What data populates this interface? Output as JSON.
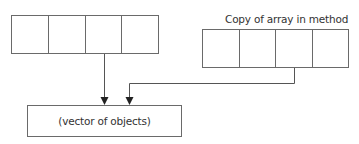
{
  "diagram": {
    "original_array": {
      "label": "",
      "cells": [
        "",
        "",
        "",
        ""
      ]
    },
    "copy_array": {
      "label": "Copy of array in method",
      "cells": [
        "",
        "",
        "",
        ""
      ]
    },
    "vector_box": {
      "label": "(vector of objects)"
    },
    "arrows": [
      {
        "from": "original_array.cell_3",
        "to": "vector_box"
      },
      {
        "from": "copy_array.cell_3",
        "to": "vector_box"
      }
    ],
    "colors": {
      "stroke": "#6a6a6a",
      "text": "#333333",
      "background": "#ffffff"
    }
  }
}
